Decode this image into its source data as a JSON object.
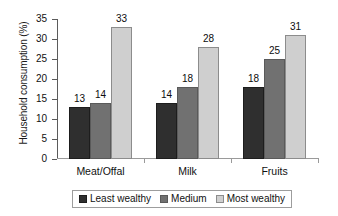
{
  "chart_data": {
    "type": "bar",
    "title": "",
    "subtitle": "",
    "xlabel": "",
    "ylabel": "Household consumption (%)",
    "categories": [
      "Meat/Offal",
      "Milk",
      "Fruits"
    ],
    "series": [
      {
        "name": "Least wealthy",
        "color": "#2f2f2f",
        "values": [
          13,
          14,
          18
        ]
      },
      {
        "name": "Medium",
        "color": "#717171",
        "values": [
          14,
          18,
          25
        ]
      },
      {
        "name": "Most wealthy",
        "color": "#cfcfcf",
        "values": [
          33,
          28,
          31
        ]
      }
    ],
    "ylim": [
      0,
      35
    ],
    "ytick_values": [
      0,
      5,
      10,
      15,
      20,
      25,
      30,
      35
    ],
    "ytick_labels": [
      "0",
      "5",
      "10",
      "15",
      "20",
      "25",
      "30",
      "35"
    ],
    "data_labels": [
      [
        "13",
        "14",
        "33"
      ],
      [
        "14",
        "18",
        "28"
      ],
      [
        "18",
        "25",
        "31"
      ]
    ],
    "grid": false,
    "legend_position": "bottom"
  }
}
